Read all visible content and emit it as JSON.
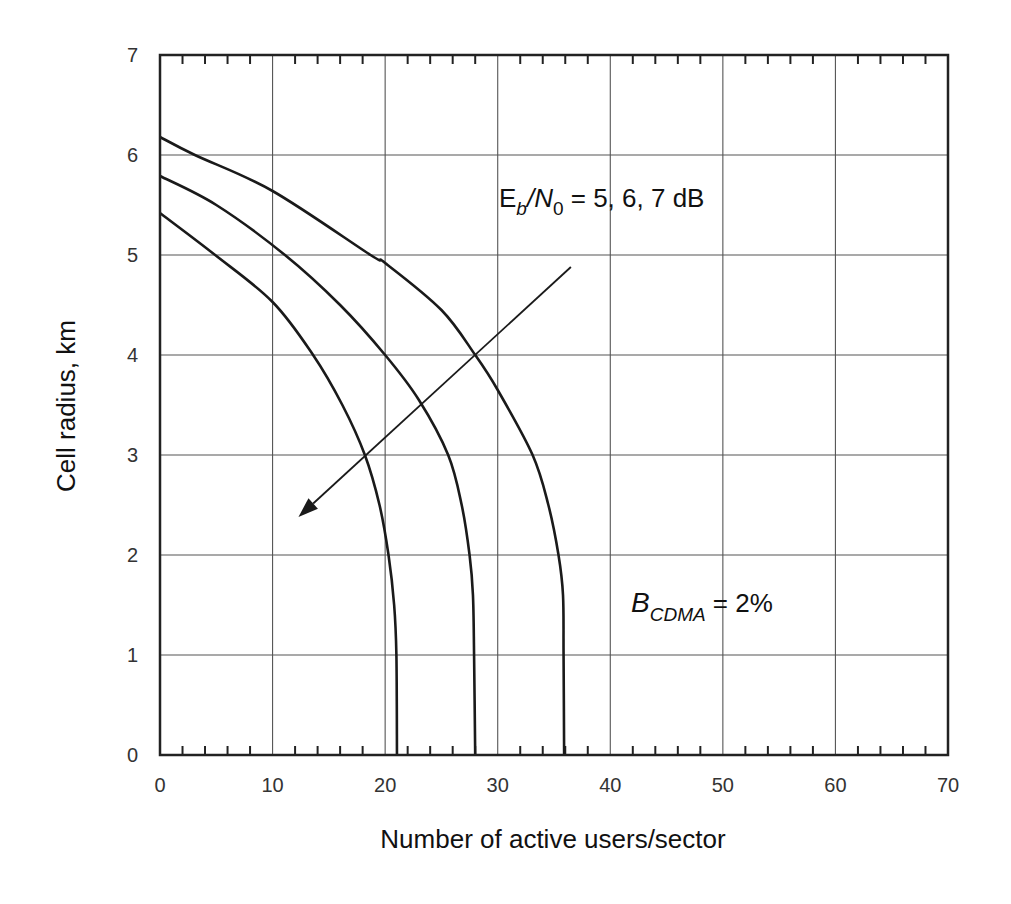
{
  "chart_data": {
    "type": "line",
    "title": "",
    "xlabel": "Number of active users/sector",
    "ylabel": "Cell radius, km",
    "xlim": [
      0,
      70
    ],
    "ylim": [
      0,
      7
    ],
    "x_ticks": [
      0,
      10,
      20,
      30,
      40,
      50,
      60,
      70
    ],
    "y_ticks": [
      0,
      1,
      2,
      3,
      4,
      5,
      6,
      7
    ],
    "x_minor_step": 2,
    "grid": true,
    "legend": null,
    "series": [
      {
        "name": "Eb/N0 = 5 dB",
        "x": [
          0,
          3.1,
          10,
          18.7,
          20,
          25,
          28,
          30,
          33.1,
          34.5,
          35.4,
          35.8,
          35.85,
          35.9
        ],
        "y": [
          6.18,
          6.0,
          5.64,
          5.0,
          4.92,
          4.45,
          4.0,
          3.65,
          3.0,
          2.5,
          2.0,
          1.6,
          1.0,
          0
        ]
      },
      {
        "name": "Eb/N0 = 6 dB",
        "x": [
          0,
          5,
          11.1,
          16,
          20,
          23,
          25.6,
          26.8,
          27.5,
          27.8,
          27.9,
          28.0
        ],
        "y": [
          5.79,
          5.5,
          5.0,
          4.5,
          4.0,
          3.55,
          3.0,
          2.5,
          2.0,
          1.6,
          1.0,
          0
        ]
      },
      {
        "name": "Eb/N0 = 7 dB",
        "x": [
          0,
          4.9,
          10,
          13.6,
          16.2,
          18.2,
          19.5,
          20.3,
          20.8,
          21.0,
          21.05
        ],
        "y": [
          5.42,
          5.0,
          4.53,
          4.0,
          3.5,
          3.0,
          2.5,
          2.0,
          1.5,
          1.0,
          0
        ]
      }
    ],
    "annotations": [
      {
        "text_main": "E",
        "text_sub1": "b",
        "text_mid": "/N",
        "text_sub2": "0",
        "text_tail": " = 5, 6, 7 dB",
        "x": 30,
        "y": 5.95
      },
      {
        "text_main": "B",
        "text_sub": "CDMA",
        "text_tail": " = 2%",
        "x": 41,
        "y": 1.45
      },
      {
        "type": "arrow",
        "from": [
          36.5,
          4.88
        ],
        "to": [
          12.3,
          2.38
        ]
      }
    ]
  },
  "labels": {
    "x_axis_title": "Number of active users/sector",
    "y_axis_title": "Cell radius, km",
    "ebn0_E": "E",
    "ebn0_b": "b",
    "ebn0_slashN": "/N",
    "ebn0_0": "0",
    "ebn0_tail": " = 5, 6, 7 dB",
    "bcdma_B": "B",
    "bcdma_sub": "CDMA",
    "bcdma_tail": " = 2%"
  },
  "style": {
    "line_color": "#1a1a1a",
    "grid_color": "#555555",
    "frame_color": "#222222"
  }
}
